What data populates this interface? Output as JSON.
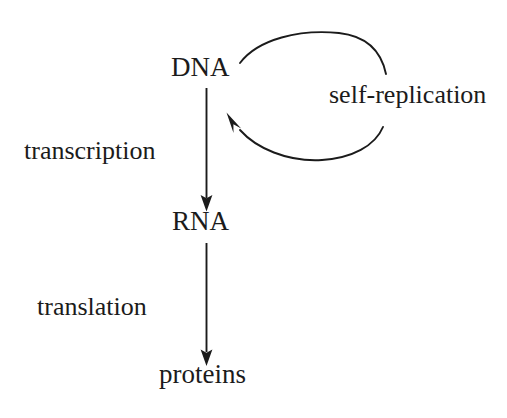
{
  "diagram": {
    "background_color": "#ffffff",
    "stroke_color": "#1b1b1b",
    "text_color": "#1b1b1b",
    "nodes": [
      {
        "id": "dna",
        "label": "DNA"
      },
      {
        "id": "rna",
        "label": "RNA"
      },
      {
        "id": "proteins",
        "label": "proteins"
      }
    ],
    "edges": [
      {
        "id": "dna-to-rna",
        "label": "transcription",
        "from": "DNA",
        "to": "RNA",
        "direction": "down"
      },
      {
        "id": "rna-to-proteins",
        "label": "translation",
        "from": "RNA",
        "to": "proteins",
        "direction": "down"
      },
      {
        "id": "dna-self-loop",
        "label": "self-replication",
        "from": "DNA",
        "to": "DNA",
        "direction": "clockwise-loop"
      }
    ]
  }
}
